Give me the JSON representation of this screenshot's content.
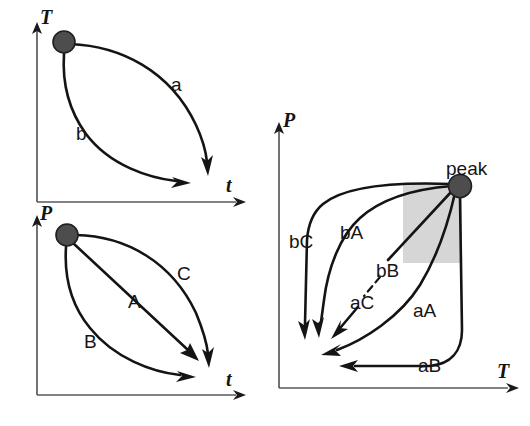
{
  "figure": {
    "background_color": "#ffffff",
    "curve_color": "#141414",
    "axis_color": "#59595b",
    "node_color": "#4d4d4d",
    "shade_color": "#cfcfcf"
  },
  "panels": [
    {
      "id": "panel-tt",
      "name": "temperature-time-panel",
      "y_axis_label": "T",
      "x_axis_label": "t",
      "start_node": "filled-circle",
      "paths": [
        {
          "label": "a",
          "from": "start",
          "to": "low-T-late-t",
          "shape": "convex-upper"
        },
        {
          "label": "b",
          "from": "start",
          "to": "low-T-mid-t",
          "shape": "concave-lower"
        }
      ]
    },
    {
      "id": "panel-pt",
      "name": "pressure-time-panel",
      "y_axis_label": "P",
      "x_axis_label": "t",
      "start_node": "filled-circle",
      "paths": [
        {
          "label": "C",
          "from": "start",
          "to": "low-P-late-t",
          "shape": "convex-upper"
        },
        {
          "label": "A",
          "from": "start",
          "to": "low-P-late-t",
          "shape": "straight"
        },
        {
          "label": "B",
          "from": "start",
          "to": "low-P-mid-t",
          "shape": "concave-lower"
        }
      ]
    },
    {
      "id": "panel-pT",
      "name": "pressure-temperature-panel",
      "y_axis_label": "P",
      "x_axis_label": "T",
      "peak_label": "peak",
      "peak_node": "filled-circle",
      "shaded_region": "grey-rectangle-below-left-of-peak",
      "paths": [
        {
          "label": "bC",
          "style": "solid",
          "description": "leaves peak leftward then descends steeply to low-T low-P"
        },
        {
          "label": "bA",
          "style": "solid",
          "description": "leaves peak leftward curving down to low-T low-P"
        },
        {
          "label": "bB",
          "style": "solid",
          "description": "straight segment from peak down-left"
        },
        {
          "label": "aC",
          "style": "dashed",
          "description": "short dashed link descending to arrow at low-T"
        },
        {
          "label": "aA",
          "style": "solid",
          "description": "curves from peak down and left along low-P"
        },
        {
          "label": "aB",
          "style": "solid",
          "description": "descends vertically from peak then turns left along bottom"
        }
      ]
    }
  ]
}
